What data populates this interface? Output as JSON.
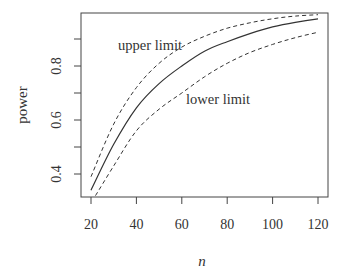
{
  "chart_data": {
    "type": "line",
    "title": "",
    "xlabel": "n",
    "ylabel": "power",
    "xlim": [
      17,
      124
    ],
    "ylim": [
      0.31,
      1.0
    ],
    "xticks": [
      20,
      40,
      60,
      80,
      100,
      120
    ],
    "yticks": [
      0.4,
      0.5,
      0.6,
      0.7,
      0.8,
      0.9
    ],
    "ytick_labels": [
      "0.4",
      "",
      "0.6",
      "",
      "0.8",
      ""
    ],
    "grid": false,
    "legend": null,
    "series": [
      {
        "name": "power",
        "style": "solid",
        "x": [
          20,
          30,
          40,
          50,
          60,
          70,
          80,
          90,
          100,
          110,
          120
        ],
        "values": [
          0.34,
          0.51,
          0.645,
          0.735,
          0.8,
          0.855,
          0.89,
          0.92,
          0.945,
          0.962,
          0.975
        ]
      },
      {
        "name": "upper limit",
        "style": "dashed",
        "x": [
          20,
          30,
          40,
          50,
          60,
          70,
          80,
          90,
          100,
          110,
          120
        ],
        "values": [
          0.39,
          0.585,
          0.72,
          0.81,
          0.87,
          0.91,
          0.94,
          0.96,
          0.975,
          0.985,
          0.99
        ]
      },
      {
        "name": "lower limit",
        "style": "dashed",
        "x": [
          22,
          30,
          40,
          50,
          60,
          70,
          80,
          90,
          100,
          110,
          120
        ],
        "values": [
          0.32,
          0.43,
          0.56,
          0.64,
          0.7,
          0.76,
          0.81,
          0.85,
          0.88,
          0.905,
          0.925
        ]
      }
    ],
    "annotations": [
      {
        "text": "upper limit",
        "x": 47,
        "y": 0.855
      },
      {
        "text": "lower limit",
        "x": 71,
        "y": 0.655
      }
    ]
  },
  "labels": {
    "xlabel": "n",
    "ylabel": "power",
    "upper_annotation": "upper limit",
    "lower_annotation": "lower limit"
  }
}
